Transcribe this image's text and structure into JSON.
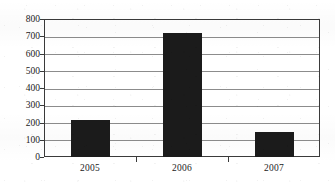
{
  "chart_data": {
    "type": "bar",
    "title": "",
    "subtitle": "",
    "xlabel": "",
    "ylabel": "",
    "categories": [
      "2005",
      "2006",
      "2007"
    ],
    "values": [
      215,
      720,
      145
    ],
    "series": [
      {
        "name": "",
        "values": [
          215,
          720,
          145
        ]
      }
    ],
    "ylim": [
      0,
      800
    ],
    "ytick_values": [
      0,
      100,
      200,
      300,
      400,
      500,
      600,
      700,
      800
    ],
    "ytick_labels": [
      "0",
      "100",
      "200",
      "300",
      "400",
      "500",
      "600",
      "700",
      "800"
    ],
    "xtick_labels": [
      "2005",
      "2006",
      "2007"
    ],
    "grid": "horizontal",
    "legend": "none",
    "annotations": [],
    "colors": {
      "bar": "#1b1b1b",
      "gridline": "#8c8c8c",
      "axis": "#3a3a3a",
      "background": "#ffffff",
      "text": "#1b1b1b"
    }
  }
}
